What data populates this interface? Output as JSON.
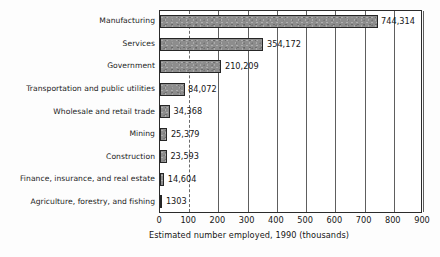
{
  "chart_data": {
    "type": "bar",
    "orientation": "horizontal",
    "title": "",
    "xlabel": "Estimated number employed, 1990 (thousands)",
    "ylabel": "",
    "xlim": [
      0,
      900
    ],
    "xticks": [
      0,
      100,
      200,
      300,
      400,
      500,
      600,
      700,
      800,
      900
    ],
    "xtick_labels": [
      "0",
      "100",
      "200",
      "300",
      "400",
      "500",
      "600",
      "700",
      "800",
      "900"
    ],
    "grid": true,
    "grid_axis": "x",
    "legend": false,
    "value_label_unit": "thousands",
    "categories": [
      "Manufacturing",
      "Services",
      "Government",
      "Transportation and public utilities",
      "Wholesale and retail trade",
      "Mining",
      "Construction",
      "Finance, insurance, and real estate",
      "Agriculture, forestry, and fishing"
    ],
    "values": [
      744.314,
      354.172,
      210.209,
      84.072,
      34.368,
      25.379,
      23.593,
      14.604,
      1.303
    ],
    "value_labels": [
      "744,314",
      "354,172",
      "210,209",
      "84,072",
      "34,368",
      "25,379",
      "23,593",
      "14,604",
      "1303"
    ],
    "bar_fill_color": "#8d8d8d",
    "bar_edge_color": "#262626",
    "gridline_color": "#5e5e5e",
    "axis_color": "#2b2b2b",
    "text_color": "#161616",
    "background_color": "#fdfdfd"
  }
}
